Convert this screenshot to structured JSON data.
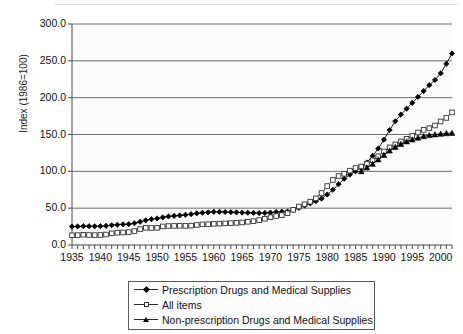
{
  "chart_data": {
    "type": "line",
    "title": "",
    "xlabel": "",
    "ylabel": "Index (1986=100)",
    "xlim": [
      1935,
      2002
    ],
    "ylim": [
      0,
      300
    ],
    "ytick_labels": [
      "0.0",
      "50.0",
      "100.0",
      "150.0",
      "200.0",
      "250.0",
      "300.0"
    ],
    "ytick_values": [
      0,
      50,
      100,
      150,
      200,
      250,
      300
    ],
    "xtick_labels": [
      "1935",
      "1940",
      "1945",
      "1950",
      "1955",
      "1960",
      "1965",
      "1970",
      "1975",
      "1980",
      "1985",
      "1990",
      "1995",
      "2000"
    ],
    "xtick_values": [
      1935,
      1940,
      1945,
      1950,
      1955,
      1960,
      1965,
      1970,
      1975,
      1980,
      1985,
      1990,
      1995,
      2000
    ],
    "grid": "horizontal",
    "legend_position": "below",
    "series": [
      {
        "name": "Prescription Drugs and Medical Supplies",
        "marker": "filled-diamond",
        "color": "#000000",
        "x": [
          1935,
          1936,
          1937,
          1938,
          1939,
          1940,
          1941,
          1942,
          1943,
          1944,
          1945,
          1946,
          1947,
          1948,
          1949,
          1950,
          1951,
          1952,
          1953,
          1954,
          1955,
          1956,
          1957,
          1958,
          1959,
          1960,
          1961,
          1962,
          1963,
          1964,
          1965,
          1966,
          1967,
          1968,
          1969,
          1970,
          1971,
          1972,
          1973,
          1974,
          1975,
          1976,
          1977,
          1978,
          1979,
          1980,
          1981,
          1982,
          1983,
          1984,
          1985,
          1986,
          1987,
          1988,
          1989,
          1990,
          1991,
          1992,
          1993,
          1994,
          1995,
          1996,
          1997,
          1998,
          1999,
          2000,
          2001,
          2002
        ],
        "values": [
          25.0,
          25.2,
          25.5,
          25.5,
          25.4,
          25.5,
          26.0,
          26.8,
          27.5,
          28.0,
          28.3,
          29.5,
          31.5,
          33.5,
          35.0,
          36.0,
          37.5,
          38.8,
          39.5,
          40.2,
          41.0,
          41.8,
          43.0,
          43.8,
          44.3,
          45.0,
          45.0,
          44.8,
          44.5,
          44.3,
          44.0,
          43.8,
          43.5,
          43.3,
          43.5,
          44.0,
          44.8,
          45.2,
          45.5,
          47.5,
          50.5,
          53.5,
          56.5,
          59.5,
          63.0,
          68.5,
          75.0,
          82.5,
          90.0,
          95.5,
          100.0,
          105.0,
          112.0,
          121.0,
          131.0,
          143.0,
          156.0,
          168.0,
          177.0,
          185.0,
          193.0,
          201.0,
          209.0,
          217.0,
          224.0,
          233.0,
          246.0,
          260.0
        ]
      },
      {
        "name": "All items",
        "marker": "open-square",
        "color": "#333333",
        "x": [
          1935,
          1936,
          1937,
          1938,
          1939,
          1940,
          1941,
          1942,
          1943,
          1944,
          1945,
          1946,
          1947,
          1948,
          1949,
          1950,
          1951,
          1952,
          1953,
          1954,
          1955,
          1956,
          1957,
          1958,
          1959,
          1960,
          1961,
          1962,
          1963,
          1964,
          1965,
          1966,
          1967,
          1968,
          1969,
          1970,
          1971,
          1972,
          1973,
          1974,
          1975,
          1976,
          1977,
          1978,
          1979,
          1980,
          1981,
          1982,
          1983,
          1984,
          1985,
          1986,
          1987,
          1988,
          1989,
          1990,
          1991,
          1992,
          1993,
          1994,
          1995,
          1996,
          1997,
          1998,
          1999,
          2000,
          2001,
          2002
        ],
        "values": [
          13.2,
          13.4,
          13.9,
          13.6,
          13.4,
          13.6,
          14.2,
          15.8,
          16.7,
          17.0,
          17.4,
          18.9,
          21.6,
          23.3,
          23.1,
          23.3,
          25.2,
          25.7,
          25.9,
          26.0,
          25.9,
          26.3,
          27.2,
          28.0,
          28.2,
          28.7,
          29.0,
          29.3,
          29.7,
          30.1,
          30.6,
          31.5,
          32.4,
          33.8,
          35.6,
          37.7,
          39.3,
          40.6,
          43.1,
          47.8,
          52.2,
          55.2,
          58.8,
          63.3,
          70.5,
          80.0,
          88.3,
          93.7,
          96.7,
          100.9,
          104.5,
          106.5,
          110.4,
          115.0,
          120.5,
          127.0,
          132.5,
          136.5,
          140.6,
          144.2,
          148.3,
          152.7,
          156.3,
          158.7,
          162.2,
          167.7,
          172.5,
          180.0
        ]
      },
      {
        "name": "Non-prescription Drugs and Medical Supplies",
        "marker": "filled-triangle",
        "color": "#000000",
        "x": [
          1986,
          1987,
          1988,
          1989,
          1990,
          1991,
          1992,
          1993,
          1994,
          1995,
          1996,
          1997,
          1998,
          1999,
          2000,
          2001,
          2002
        ],
        "values": [
          100.0,
          105.0,
          110.0,
          116.0,
          122.0,
          128.0,
          133.0,
          137.0,
          140.5,
          143.0,
          145.5,
          147.5,
          149.0,
          150.0,
          150.8,
          151.5,
          152.0
        ]
      }
    ]
  },
  "legend": {
    "entries": [
      {
        "label": "Prescription Drugs and Medical Supplies",
        "marker": "filled-diamond"
      },
      {
        "label": "All items",
        "marker": "open-square"
      },
      {
        "label": "Non-prescription Drugs and Medical Supplies",
        "marker": "filled-triangle"
      }
    ]
  }
}
